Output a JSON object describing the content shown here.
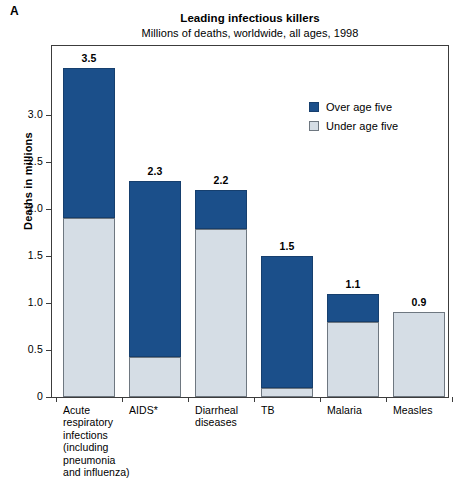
{
  "panel_label": "A",
  "chart_data": {
    "type": "bar",
    "subtype": "stacked-vertical",
    "title": "Leading infectious killers",
    "subtitle": "Millions of deaths, worldwide, all ages, 1998",
    "xlabel": "",
    "ylabel": "Deaths in millions",
    "ylim": [
      0,
      3.75
    ],
    "yticks": [
      0,
      0.5,
      1.0,
      1.5,
      2.0,
      2.5,
      3.0
    ],
    "ytick_labels": [
      "0",
      "0.5",
      "1.0",
      "1.5",
      "2.0",
      "2.5",
      "3.0"
    ],
    "grid": false,
    "legend_position": "upper-right-inside",
    "categories": [
      "Acute\nrespiratory\ninfections\n(including\npneumonia\nand influenza)",
      "AIDS*",
      "Diarrheal\ndiseases",
      "TB",
      "Malaria",
      "Measles"
    ],
    "category_labels": [
      [
        "Acute",
        "respiratory",
        "infections",
        "(including",
        "pneumonia",
        "and influenza)"
      ],
      [
        "AIDS*"
      ],
      [
        "Diarrheal",
        "diseases"
      ],
      [
        "TB"
      ],
      [
        "Malaria"
      ],
      [
        "Measles"
      ]
    ],
    "series": [
      {
        "name": "Under age five",
        "color": "#d5dde5",
        "values": [
          1.9,
          0.43,
          1.79,
          0.1,
          0.8,
          0.9
        ]
      },
      {
        "name": "Over age five",
        "color": "#1b4f8a",
        "values": [
          1.6,
          1.87,
          0.41,
          1.4,
          0.3,
          0.0
        ]
      }
    ],
    "totals": [
      3.5,
      2.3,
      2.2,
      1.5,
      1.1,
      0.9
    ],
    "total_labels": [
      "3.5",
      "2.3",
      "2.2",
      "1.5",
      "1.1",
      "0.9"
    ]
  },
  "legend": {
    "items": [
      {
        "label": "Over age five",
        "key": "over"
      },
      {
        "label": "Under age five",
        "key": "under"
      }
    ]
  }
}
